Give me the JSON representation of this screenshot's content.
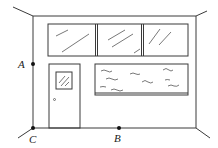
{
  "diagram": {
    "type": "room-wall-line-drawing",
    "points": [
      {
        "label": "A",
        "position": "left wall edge, mid-height"
      },
      {
        "label": "B",
        "position": "floor line, middle"
      },
      {
        "label": "C",
        "position": "bottom-left corner"
      }
    ],
    "labels": {
      "A": "A",
      "B": "B",
      "C": "C"
    },
    "colors": {
      "line": "#3a3a3a",
      "background": "#ffffff"
    }
  }
}
